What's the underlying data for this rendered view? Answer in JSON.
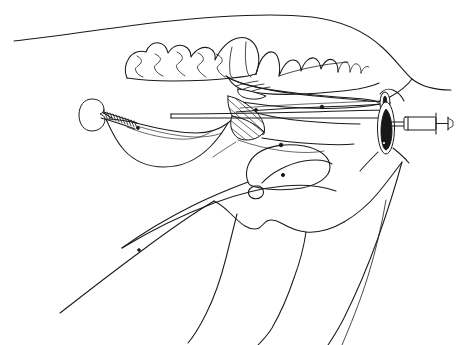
{
  "figure": {
    "title": "Nasogastric intubation in the horse",
    "style": "black ink line drawing on white background",
    "background_color": "#ffffff",
    "ink_color": "#1a1a1a",
    "shading_color": "#171717",
    "width_px": 457,
    "height_px": 345
  },
  "labels": {
    "head_outline": "dorsal head profile",
    "upper_teeth": "upper cheek teeth arcade",
    "lower_teeth": "lower cheek teeth arcade",
    "hard_palate": "hard palate",
    "soft_palate": "soft palate",
    "tongue": "tongue",
    "epiglottis": "epiglottis",
    "larynx": "larynx",
    "hyoid": "hyoid apparatus",
    "trachea": "trachea",
    "esophagus": "esophagus",
    "nasal_passage": "nasal passage",
    "nostril": "nostril",
    "mandible": "mandible / jaw line",
    "throat_latch": "throat latch",
    "tube": "nasogastric tube",
    "cuff": "inflated cuff / balloon",
    "coil": "coiled tube segment",
    "syringe": "syringe",
    "syringe_barrel": "syringe barrel",
    "syringe_plunger": "syringe plunger",
    "syringe_flange": "syringe flange"
  },
  "elements": {
    "teeth_count_upper": 7,
    "teeth_count_lower": 8,
    "shaded_regions": 3,
    "instrument_parts": [
      "tube",
      "cuff",
      "coil",
      "syringe"
    ]
  }
}
